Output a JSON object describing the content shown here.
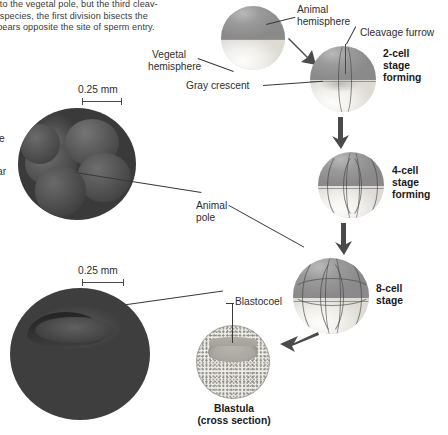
{
  "figure": {
    "scale_bar_label": "0.25 mm"
  },
  "body_text": {
    "line1": "e to the vegetal pole, but the third cleav-",
    "line2": "e species, the first division bisects the",
    "line3": "opears opposite the site of sperm entry."
  },
  "cropped_left_labels": {
    "frag1": "e",
    "frag2": "ar"
  },
  "labels": {
    "animal_hemisphere_l1": "Animal",
    "animal_hemisphere_l2": "hemisphere",
    "vegetal_hemisphere_l1": "Vegetal",
    "vegetal_hemisphere_l2": "hemisphere",
    "gray_crescent": "Gray crescent",
    "cleavage_furrow": "Cleavage furrow",
    "animal_pole_l1": "Animal",
    "animal_pole_l2": "pole",
    "blastocoel": "Blastocoel"
  },
  "stages": {
    "two_cell_l1": "2-cell",
    "two_cell_l2": "stage",
    "two_cell_l3": "forming",
    "four_cell_l1": "4-cell",
    "four_cell_l2": "stage",
    "four_cell_l3": "forming",
    "eight_cell_l1": "8-cell",
    "eight_cell_l2": "stage",
    "blastula_l1": "Blastula",
    "blastula_l2": "(cross section)"
  },
  "scale_bars": {
    "upper": "0.25 mm",
    "lower": "0.25 mm"
  },
  "colors": {
    "animal_hemisphere": "#9a9a9a",
    "vegetal_hemisphere": "#f1f0ec",
    "leader_line": "#3a3a3a",
    "arrow": "#4a4a4a",
    "text": "#2e2e2e",
    "background": "#ffffff"
  }
}
